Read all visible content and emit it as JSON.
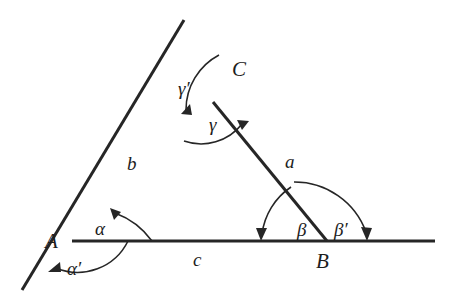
{
  "figure": {
    "stroke_color": "#262626",
    "label_color": "#1d1d1d",
    "background": "#ffffff",
    "line_width": 3,
    "arc_width": 1.6,
    "vertices": [
      {
        "name": "A",
        "label": "A",
        "x": 72,
        "y": 241,
        "label_x": 45,
        "label_y": 248
      },
      {
        "name": "B",
        "label": "B",
        "x": 327,
        "y": 241,
        "label_x": 316,
        "label_y": 268
      },
      {
        "name": "C",
        "label": "C",
        "x": 213,
        "y": 102,
        "label_x": 232,
        "label_y": 76
      }
    ],
    "sides": [
      {
        "name": "a",
        "label": "a",
        "from": "C",
        "to": "B",
        "label_x": 285,
        "label_y": 168
      },
      {
        "name": "b",
        "label": "b",
        "from": "A",
        "to": "C",
        "label_x": 127,
        "label_y": 170
      },
      {
        "name": "c",
        "label": "c",
        "from": "A",
        "to": "B",
        "label_x": 193,
        "label_y": 266
      }
    ],
    "lines": [
      {
        "name": "line-b-extended",
        "x1": 22,
        "y1": 290,
        "x2": 184,
        "y2": 20
      },
      {
        "name": "line-c-extended",
        "x1": 72,
        "y1": 241,
        "x2": 435,
        "y2": 241
      },
      {
        "name": "line-a",
        "x1": 213,
        "y1": 102,
        "x2": 327,
        "y2": 241
      }
    ],
    "angles": [
      {
        "name": "alpha",
        "label": "α",
        "vertex": "A",
        "label_x": 95,
        "label_y": 235,
        "kind": "interior"
      },
      {
        "name": "alpha-prime",
        "label": "α′",
        "vertex": "A",
        "label_x": 67,
        "label_y": 275,
        "kind": "exterior"
      },
      {
        "name": "beta",
        "label": "β",
        "vertex": "B",
        "label_x": 297,
        "label_y": 236,
        "kind": "interior"
      },
      {
        "name": "beta-prime",
        "label": "β′",
        "vertex": "B",
        "label_x": 334,
        "label_y": 236,
        "kind": "exterior"
      },
      {
        "name": "gamma",
        "label": "γ",
        "vertex": "C",
        "label_x": 209,
        "label_y": 131,
        "kind": "interior"
      },
      {
        "name": "gamma-prime",
        "label": "γ′",
        "vertex": "C",
        "label_x": 178,
        "label_y": 95,
        "kind": "exterior"
      }
    ]
  }
}
